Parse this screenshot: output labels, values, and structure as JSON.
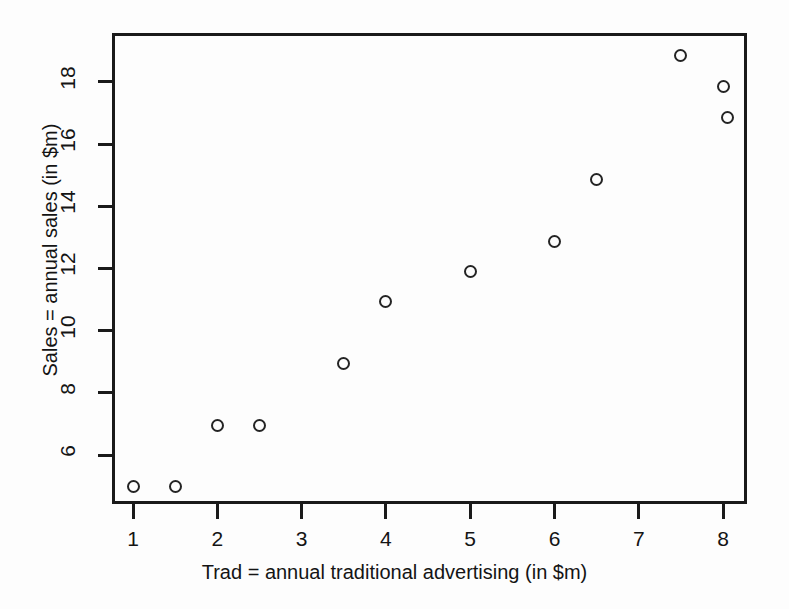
{
  "chart_data": {
    "type": "scatter",
    "title": "",
    "xlabel": "Trad = annual traditional advertising (in $m)",
    "ylabel": "Sales = annual sales (in $m)",
    "xlim": [
      0.72,
      8.25
    ],
    "ylim": [
      4.75,
      19.25
    ],
    "xticks": [
      1,
      2,
      3,
      4,
      5,
      6,
      7,
      8
    ],
    "yticks": [
      6,
      8,
      10,
      12,
      14,
      16,
      18
    ],
    "xticklabels": [
      "1",
      "2",
      "3",
      "4",
      "5",
      "6",
      "7",
      "8"
    ],
    "yticklabels": [
      "6",
      "8",
      "10",
      "12",
      "14",
      "16",
      "18"
    ],
    "grid": false,
    "legend": false,
    "marker": "open-circle",
    "marker_color": "#242424",
    "frame_color": "#1a1a1a",
    "background_color": "#fdfdfd",
    "x": [
      1.0,
      1.5,
      2.0,
      2.5,
      3.5,
      4.0,
      5.0,
      6.0,
      6.5,
      7.5,
      8.0,
      8.05
    ],
    "y": [
      5.0,
      5.0,
      6.95,
      6.95,
      8.95,
      10.95,
      11.9,
      12.85,
      14.85,
      18.85,
      17.85,
      16.85
    ],
    "points": [
      {
        "x": 1.0,
        "y": 5.0
      },
      {
        "x": 1.5,
        "y": 5.0
      },
      {
        "x": 2.0,
        "y": 6.95
      },
      {
        "x": 2.5,
        "y": 6.95
      },
      {
        "x": 3.5,
        "y": 8.95
      },
      {
        "x": 4.0,
        "y": 10.95
      },
      {
        "x": 5.0,
        "y": 11.9
      },
      {
        "x": 6.0,
        "y": 12.85
      },
      {
        "x": 6.5,
        "y": 14.85
      },
      {
        "x": 7.5,
        "y": 18.85
      },
      {
        "x": 8.0,
        "y": 17.85
      },
      {
        "x": 8.05,
        "y": 16.85
      }
    ]
  }
}
